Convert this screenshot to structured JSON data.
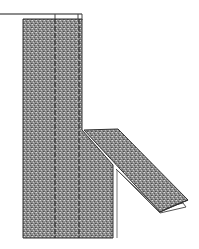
{
  "diagram": {
    "type": "sewing-illustration",
    "colors": {
      "fabric": "#8a8a8a",
      "outline": "#3a3a3a",
      "background": "#ffffff",
      "stitch": "#222222"
    },
    "elements": [
      {
        "id": "top-edge-line",
        "label": ""
      },
      {
        "id": "fabric-panel",
        "label": ""
      },
      {
        "id": "stitch-line-left",
        "label": ""
      },
      {
        "id": "stitch-line-right",
        "label": ""
      },
      {
        "id": "folded-flap",
        "label": ""
      }
    ]
  }
}
